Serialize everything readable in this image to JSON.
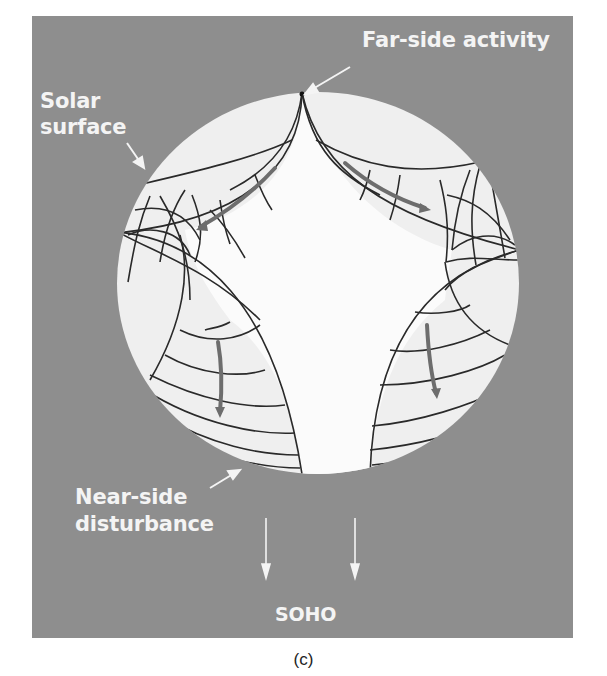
{
  "figure": {
    "caption": "(c)",
    "labels": {
      "far_side": "Far-side activity",
      "solar_surface_line1": "Solar",
      "solar_surface_line2": "surface",
      "near_side_line1": "Near-side",
      "near_side_line2": "disturbance",
      "observer": "SOHO"
    },
    "colors": {
      "background_panel": "#8e8e8e",
      "sun_disk": "#efefef",
      "inner_region": "#fbfbfb",
      "ray_lines": "#2a2a2a",
      "flow_arrows": "#6d6d6d",
      "label_text": "#f4f4f4",
      "caption_text": "#222222"
    }
  }
}
